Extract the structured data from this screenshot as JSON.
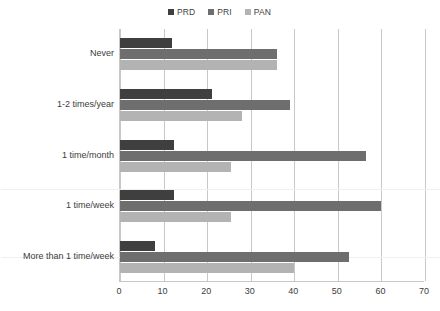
{
  "chart_data": {
    "type": "bar",
    "orientation": "horizontal",
    "title": "",
    "xlabel": "",
    "ylabel": "",
    "xlim": [
      0,
      70
    ],
    "xticks": [
      0,
      10,
      20,
      30,
      40,
      50,
      60,
      70
    ],
    "grid": "vertical",
    "legend_position": "top-center",
    "categories": [
      "Never",
      "1-2 times/year",
      "1 time/month",
      "1 time/week",
      "More than 1 time/week"
    ],
    "series": [
      {
        "name": "PRD",
        "color": "#3f3f3f",
        "values": [
          12,
          21,
          12.5,
          12.5,
          8
        ]
      },
      {
        "name": "PRI",
        "color": "#6e6e6e",
        "values": [
          36,
          39,
          56.5,
          60,
          52.5
        ]
      },
      {
        "name": "PAN",
        "color": "#b3b3b3",
        "values": [
          36,
          28,
          25.5,
          25.5,
          40
        ]
      }
    ]
  },
  "legend": {
    "entries": [
      {
        "label": "PRD",
        "color": "#3f3f3f"
      },
      {
        "label": "PRI",
        "color": "#6e6e6e"
      },
      {
        "label": "PAN",
        "color": "#b3b3b3"
      }
    ]
  },
  "axes": {
    "x_tick_labels": [
      "0",
      "10",
      "20",
      "30",
      "40",
      "50",
      "60",
      "70"
    ],
    "y_tick_labels": [
      "Never",
      "1-2 times/year",
      "1 time/month",
      "1 time/week",
      "More than 1 time/week"
    ]
  },
  "colors": {
    "background": "#ffffff",
    "gridline": "#c8c8c8",
    "axis_text": "#3c3c3c",
    "legend_text": "#404040",
    "faint_rule": "#f2eef0"
  }
}
